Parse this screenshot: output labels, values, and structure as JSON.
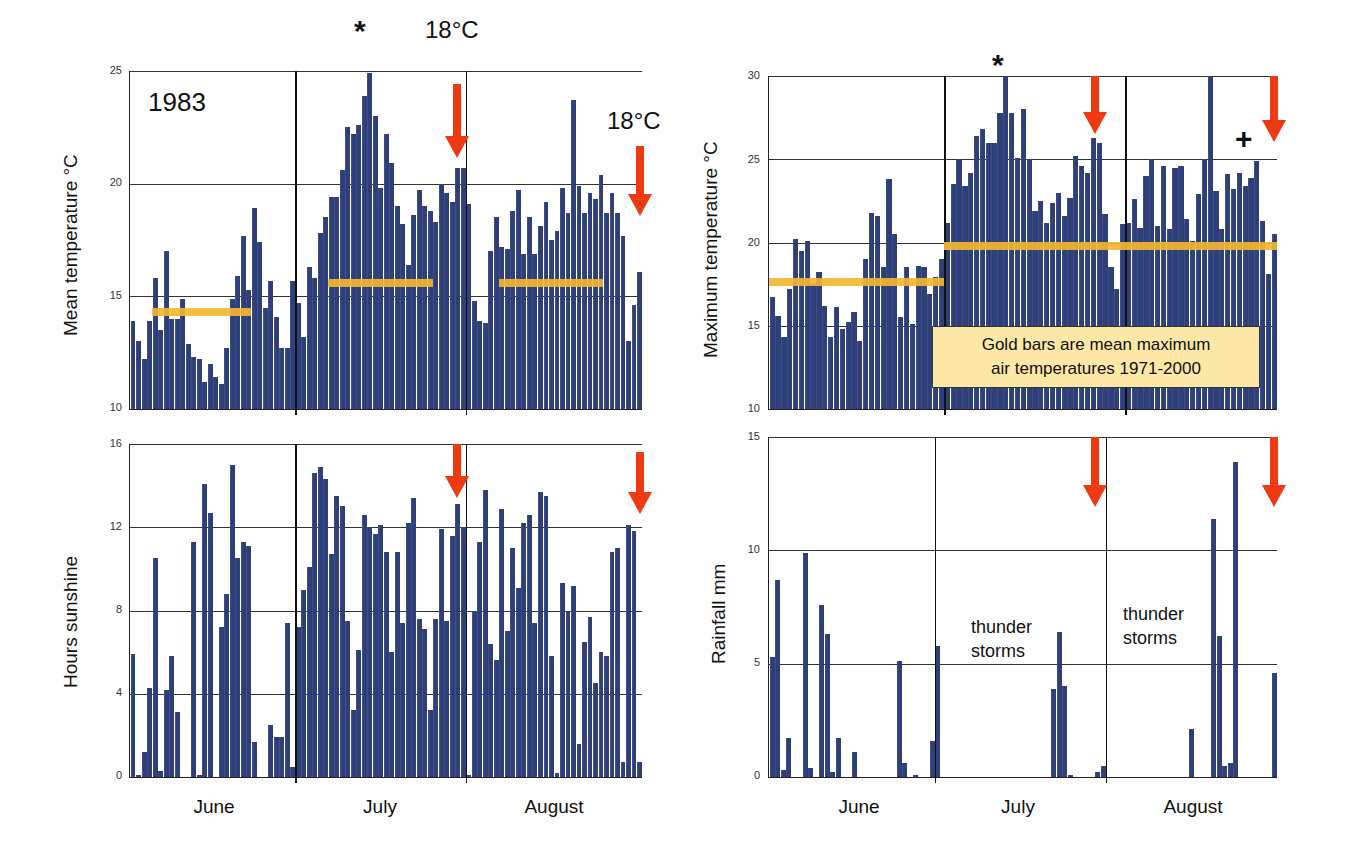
{
  "chart_data": [
    {
      "id": "mean_temp",
      "type": "bar",
      "title": "",
      "annotation_year": "1983",
      "xlabel": "",
      "ylabel": "Mean temperature °C",
      "ylim": [
        10,
        25
      ],
      "yticks": [
        10,
        15,
        20,
        25
      ],
      "grid": true,
      "months": [
        "June",
        "July",
        "August"
      ],
      "days_per_month": [
        30,
        31,
        31
      ],
      "values": [
        13.9,
        13.0,
        12.2,
        13.9,
        15.8,
        13.5,
        17.0,
        14.0,
        14.0,
        14.9,
        12.9,
        12.3,
        12.2,
        11.2,
        12.0,
        11.4,
        11.1,
        12.7,
        14.9,
        15.9,
        17.7,
        15.3,
        18.9,
        17.4,
        14.5,
        15.7,
        14.1,
        12.7,
        12.7,
        15.7,
        14.7,
        13.2,
        16.3,
        15.8,
        17.8,
        18.5,
        19.4,
        19.4,
        20.6,
        22.5,
        22.2,
        22.6,
        23.9,
        24.9,
        23.0,
        19.8,
        22.2,
        20.9,
        19.0,
        18.2,
        16.4,
        18.6,
        19.7,
        19.0,
        18.8,
        18.3,
        20.0,
        19.6,
        19.2,
        20.7,
        20.7,
        19.1,
        14.8,
        13.9,
        13.8,
        17.0,
        18.5,
        17.2,
        17.1,
        18.8,
        19.7,
        16.9,
        18.5,
        16.9,
        18.1,
        19.2,
        17.5,
        17.9,
        19.8,
        18.7,
        23.7,
        19.9,
        18.7,
        19.6,
        19.3,
        20.4,
        18.7,
        19.6,
        18.7,
        17.7,
        13.0,
        14.6,
        16.1
      ],
      "reference_bars": [
        {
          "month": "June",
          "value": 14.3
        },
        {
          "month": "July",
          "value": 15.6
        },
        {
          "month": "August",
          "value": 15.6
        }
      ],
      "annotations": [
        {
          "text": "*",
          "note": "peak mean temperature in July"
        },
        {
          "text": "18°C",
          "note": "arrow near end of July"
        },
        {
          "text": "18°C",
          "note": "arrow at end of August"
        }
      ]
    },
    {
      "id": "max_temp",
      "type": "bar",
      "title": "",
      "xlabel": "",
      "ylabel": "Maximum temperature °C",
      "ylim": [
        10,
        30
      ],
      "yticks": [
        10,
        15,
        20,
        25,
        30
      ],
      "grid": true,
      "months": [
        "June",
        "July",
        "August"
      ],
      "days_per_month": [
        30,
        31,
        31
      ],
      "values": [
        16.7,
        15.6,
        14.3,
        17.2,
        20.2,
        19.5,
        20.1,
        17.5,
        18.2,
        16.2,
        14.3,
        16.1,
        14.8,
        15.2,
        15.8,
        14.1,
        19.0,
        21.8,
        21.6,
        18.5,
        23.8,
        20.5,
        15.5,
        18.5,
        15.1,
        18.6,
        18.5,
        16.9,
        17.9,
        19.0,
        21.2,
        23.5,
        25.0,
        23.4,
        24.2,
        26.4,
        26.8,
        26.0,
        26.0,
        27.8,
        30.0,
        27.8,
        25.1,
        28.0,
        25.0,
        21.9,
        22.5,
        21.2,
        22.4,
        23.0,
        21.6,
        22.7,
        25.2,
        24.6,
        24.2,
        26.3,
        26.0,
        21.7,
        18.5,
        17.2,
        21.1,
        21.2,
        22.6,
        20.9,
        24.0,
        25.0,
        21.0,
        24.6,
        20.8,
        24.5,
        24.6,
        21.4,
        20.1,
        22.9,
        25.0,
        30.0,
        23.1,
        20.8,
        24.1,
        23.2,
        24.2,
        23.4,
        23.9,
        24.9,
        21.3,
        18.1,
        20.5
      ],
      "reference_bars": [
        {
          "month": "June",
          "value": 17.6
        },
        {
          "month": "July-August",
          "value": 19.8
        }
      ],
      "legend_note": "Gold bars are mean maximum air temperatures 1971-2000",
      "annotations": [
        {
          "text": "*",
          "note": "peak in July"
        },
        {
          "text": "+",
          "note": "late August"
        }
      ]
    },
    {
      "id": "sunshine",
      "type": "bar",
      "title": "",
      "xlabel": "",
      "ylabel": "Hours sunshine",
      "ylim": [
        0,
        16
      ],
      "yticks": [
        0,
        4,
        8,
        12,
        16
      ],
      "grid": true,
      "months": [
        "June",
        "July",
        "August"
      ],
      "days_per_month": [
        30,
        31,
        31
      ],
      "values": [
        5.9,
        0.1,
        1.2,
        4.3,
        10.5,
        0.3,
        4.2,
        5.8,
        3.1,
        0.0,
        0.0,
        11.3,
        0.1,
        14.1,
        12.7,
        0.0,
        7.2,
        8.8,
        15.0,
        10.5,
        11.3,
        11.1,
        1.7,
        0.0,
        0.0,
        2.5,
        1.9,
        1.9,
        7.4,
        0.5,
        7.2,
        9.0,
        10.1,
        14.6,
        14.9,
        14.3,
        10.7,
        13.5,
        13.0,
        7.5,
        3.2,
        6.1,
        12.6,
        12.0,
        11.7,
        12.1,
        10.8,
        6.0,
        10.8,
        7.4,
        12.2,
        13.4,
        7.6,
        7.1,
        3.2,
        7.6,
        11.9,
        7.5,
        11.6,
        13.1,
        12.0,
        0.1,
        8.0,
        11.3,
        13.8,
        6.4,
        5.6,
        12.9,
        7.0,
        11.0,
        9.1,
        12.2,
        12.6,
        7.4,
        13.7,
        13.5,
        5.8,
        0.2,
        9.3,
        8.0,
        9.2,
        1.6,
        6.5,
        7.7,
        4.5,
        6.0,
        5.8,
        10.8,
        11.0,
        0.7,
        12.1,
        11.8,
        0.7
      ]
    },
    {
      "id": "rainfall",
      "type": "bar",
      "title": "",
      "xlabel": "",
      "ylabel": "Rainfall mm",
      "ylim": [
        0,
        15
      ],
      "yticks": [
        0,
        5,
        10,
        15
      ],
      "grid": true,
      "months": [
        "June",
        "July",
        "August"
      ],
      "days_per_month": [
        30,
        31,
        31
      ],
      "values": [
        5.3,
        8.7,
        0.3,
        1.7,
        0,
        0,
        9.9,
        0.4,
        0,
        7.6,
        6.3,
        0.2,
        1.7,
        0,
        0,
        1.1,
        0,
        0,
        0,
        0,
        0,
        0,
        0,
        5.1,
        0.6,
        0,
        0.1,
        0,
        0,
        1.6,
        5.8,
        0,
        0,
        0,
        0,
        0,
        0,
        0,
        0,
        0,
        0,
        0,
        0,
        0,
        0,
        0,
        0,
        0,
        0,
        0,
        0,
        3.9,
        6.4,
        4.0,
        0.1,
        0,
        0,
        0,
        0,
        0.2,
        0.5,
        0,
        0,
        0,
        0,
        0,
        0,
        0,
        0,
        0,
        0,
        0,
        0,
        0,
        0,
        0,
        2.1,
        0,
        0,
        0,
        11.4,
        6.2,
        0.5,
        0.6,
        13.9,
        0,
        0,
        0,
        0,
        0,
        0,
        4.6
      ],
      "annotations": [
        {
          "text": "thunder storms",
          "month": "July"
        },
        {
          "text": "thunder storms",
          "month": "August"
        }
      ]
    }
  ],
  "labels": {
    "year": "1983",
    "star": "*",
    "plus": "+",
    "threshold_1": "18°C",
    "threshold_2": "18°C",
    "months": [
      "June",
      "July",
      "August"
    ],
    "mean_temp_ylabel": "Mean temperature °C",
    "max_temp_ylabel": "Maximum temperature °C",
    "sunshine_ylabel": "Hours sunshine",
    "rainfall_ylabel": "Rainfall mm",
    "legend_note_line1": "Gold bars are mean maximum",
    "legend_note_line2": "air temperatures 1971-2000",
    "storm_line1": "thunder",
    "storm_line2": "storms"
  },
  "colors": {
    "bar": "#2f3f78",
    "gold_reference": "#f2b632",
    "arrow": "#ee3a12",
    "note_background": "#fbe7a6",
    "grid": "#333333"
  }
}
